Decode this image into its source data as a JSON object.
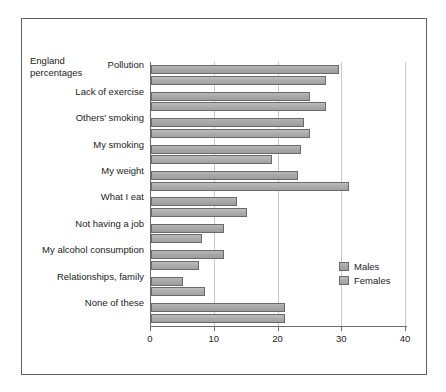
{
  "caption": "England\npercentages",
  "chart_data": {
    "type": "bar",
    "orientation": "horizontal",
    "title": "",
    "subtitle": "",
    "xlabel": "",
    "ylabel": "",
    "caption": "England percentages",
    "categories": [
      "Pollution",
      "Lack of exercise",
      "Others' smoking",
      "My smoking",
      "My weight",
      "What I eat",
      "Not having a job",
      "My alcohol consumption",
      "Relationships, family",
      "None of these"
    ],
    "series": [
      {
        "name": "Males",
        "color": "#a8a8a8",
        "values": [
          29.5,
          25,
          24,
          23.5,
          23,
          13.5,
          11.5,
          11.5,
          5,
          21
        ]
      },
      {
        "name": "Females",
        "color": "#adadad",
        "values": [
          27.5,
          27.5,
          25,
          19,
          31,
          15,
          8,
          7.5,
          8.5,
          21
        ]
      }
    ],
    "xlim": [
      0,
      40
    ],
    "xticks": [
      0,
      10,
      20,
      30,
      40
    ],
    "xticklabels": [
      "0",
      "10",
      "20",
      "30",
      "40"
    ],
    "grid": "vertical",
    "legend_position": "center-right",
    "legend_entries": [
      "Males",
      "Females"
    ]
  }
}
